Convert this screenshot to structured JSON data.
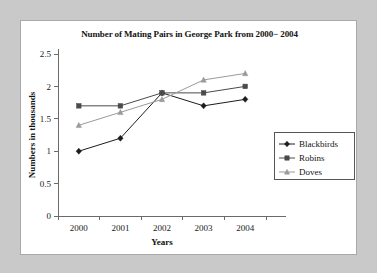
{
  "chart_data": {
    "type": "line",
    "title": "Number of Mating Pairs in George Park from 2000− 2004",
    "xlabel": "Years",
    "ylabel": "Numbers in thousands",
    "categories": [
      "2000",
      "2001",
      "2002",
      "2003",
      "2004"
    ],
    "yticks": [
      "0",
      "0.5",
      "1",
      "1.5",
      "2",
      "2.5"
    ],
    "ylim": [
      0,
      2.5
    ],
    "grid": false,
    "legend_position": "right",
    "series": [
      {
        "name": "Blackbirds",
        "marker": "diamond",
        "color": "#1c1c1c",
        "values": [
          1.0,
          1.2,
          1.9,
          1.7,
          1.8
        ]
      },
      {
        "name": "Robins",
        "marker": "square",
        "color": "#4a4a4a",
        "values": [
          1.7,
          1.7,
          1.9,
          1.9,
          2.0
        ]
      },
      {
        "name": "Doves",
        "marker": "triangle",
        "color": "#9a9a9a",
        "values": [
          1.4,
          1.6,
          1.8,
          2.1,
          2.2
        ]
      }
    ]
  },
  "colors": {
    "background": "#c9c9c9",
    "panel": "#ffffff",
    "axis": "#6b6b6b",
    "text": "#141414"
  }
}
